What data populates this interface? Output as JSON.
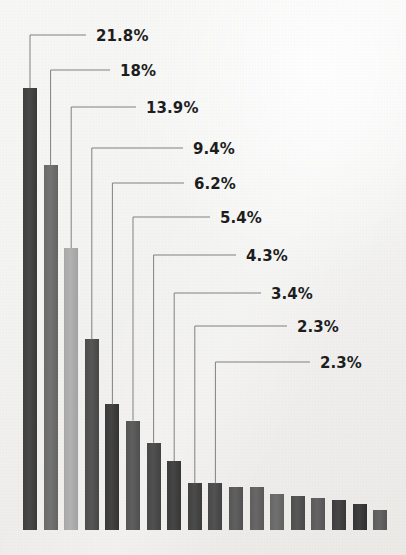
{
  "chart_data": {
    "type": "bar",
    "title": "",
    "subtitle": "",
    "xlabel": "",
    "ylabel": "",
    "grid": false,
    "legend": false,
    "axis_visible": false,
    "tick_labels": [],
    "ylim": [
      0,
      23
    ],
    "unit": "%",
    "categories": [
      "1",
      "2",
      "3",
      "4",
      "5",
      "6",
      "7",
      "8",
      "9",
      "10",
      "11",
      "12",
      "13",
      "14",
      "15",
      "16",
      "17",
      "18"
    ],
    "values": [
      21.8,
      18.0,
      13.9,
      9.4,
      6.2,
      5.4,
      4.3,
      3.4,
      2.3,
      2.3,
      2.1,
      2.1,
      1.8,
      1.7,
      1.6,
      1.5,
      1.3,
      1.0
    ],
    "labeled_count": 10,
    "data_labels": [
      "21.8%",
      "18%",
      "13.9%",
      "9.4%",
      "6.2%",
      "5.4%",
      "4.3%",
      "3.4%",
      "2.3%",
      "2.3%"
    ],
    "bar_colors": [
      "#3f3f3f",
      "#6a6a6a",
      "#a8a8a8",
      "#4d4d4d",
      "#3a3a3a",
      "#555555",
      "#474747",
      "#3c3c3c",
      "#414141",
      "#484848",
      "#565656",
      "#5e5e5e",
      "#666666",
      "#4e4e4e",
      "#5a5a5a",
      "#3d3d3d",
      "#353535",
      "#5c5c5c"
    ],
    "background_color": "#f2f1ef",
    "leader_line_color": "#808080",
    "label_text_color": "#1d1d1d"
  },
  "callouts": [
    {
      "text": "21.8%",
      "label_x": 96,
      "label_y": 27
    },
    {
      "text": "18%",
      "label_x": 120,
      "label_y": 62
    },
    {
      "text": "13.9%",
      "label_x": 146,
      "label_y": 99
    },
    {
      "text": "9.4%",
      "label_x": 193,
      "label_y": 140
    },
    {
      "text": "6.2%",
      "label_x": 194,
      "label_y": 175
    },
    {
      "text": "5.4%",
      "label_x": 220,
      "label_y": 209
    },
    {
      "text": "4.3%",
      "label_x": 246,
      "label_y": 247
    },
    {
      "text": "3.4%",
      "label_x": 271,
      "label_y": 285
    },
    {
      "text": "2.3%",
      "label_x": 297,
      "label_y": 318
    },
    {
      "text": "2.3%",
      "label_x": 320,
      "label_y": 354
    }
  ]
}
